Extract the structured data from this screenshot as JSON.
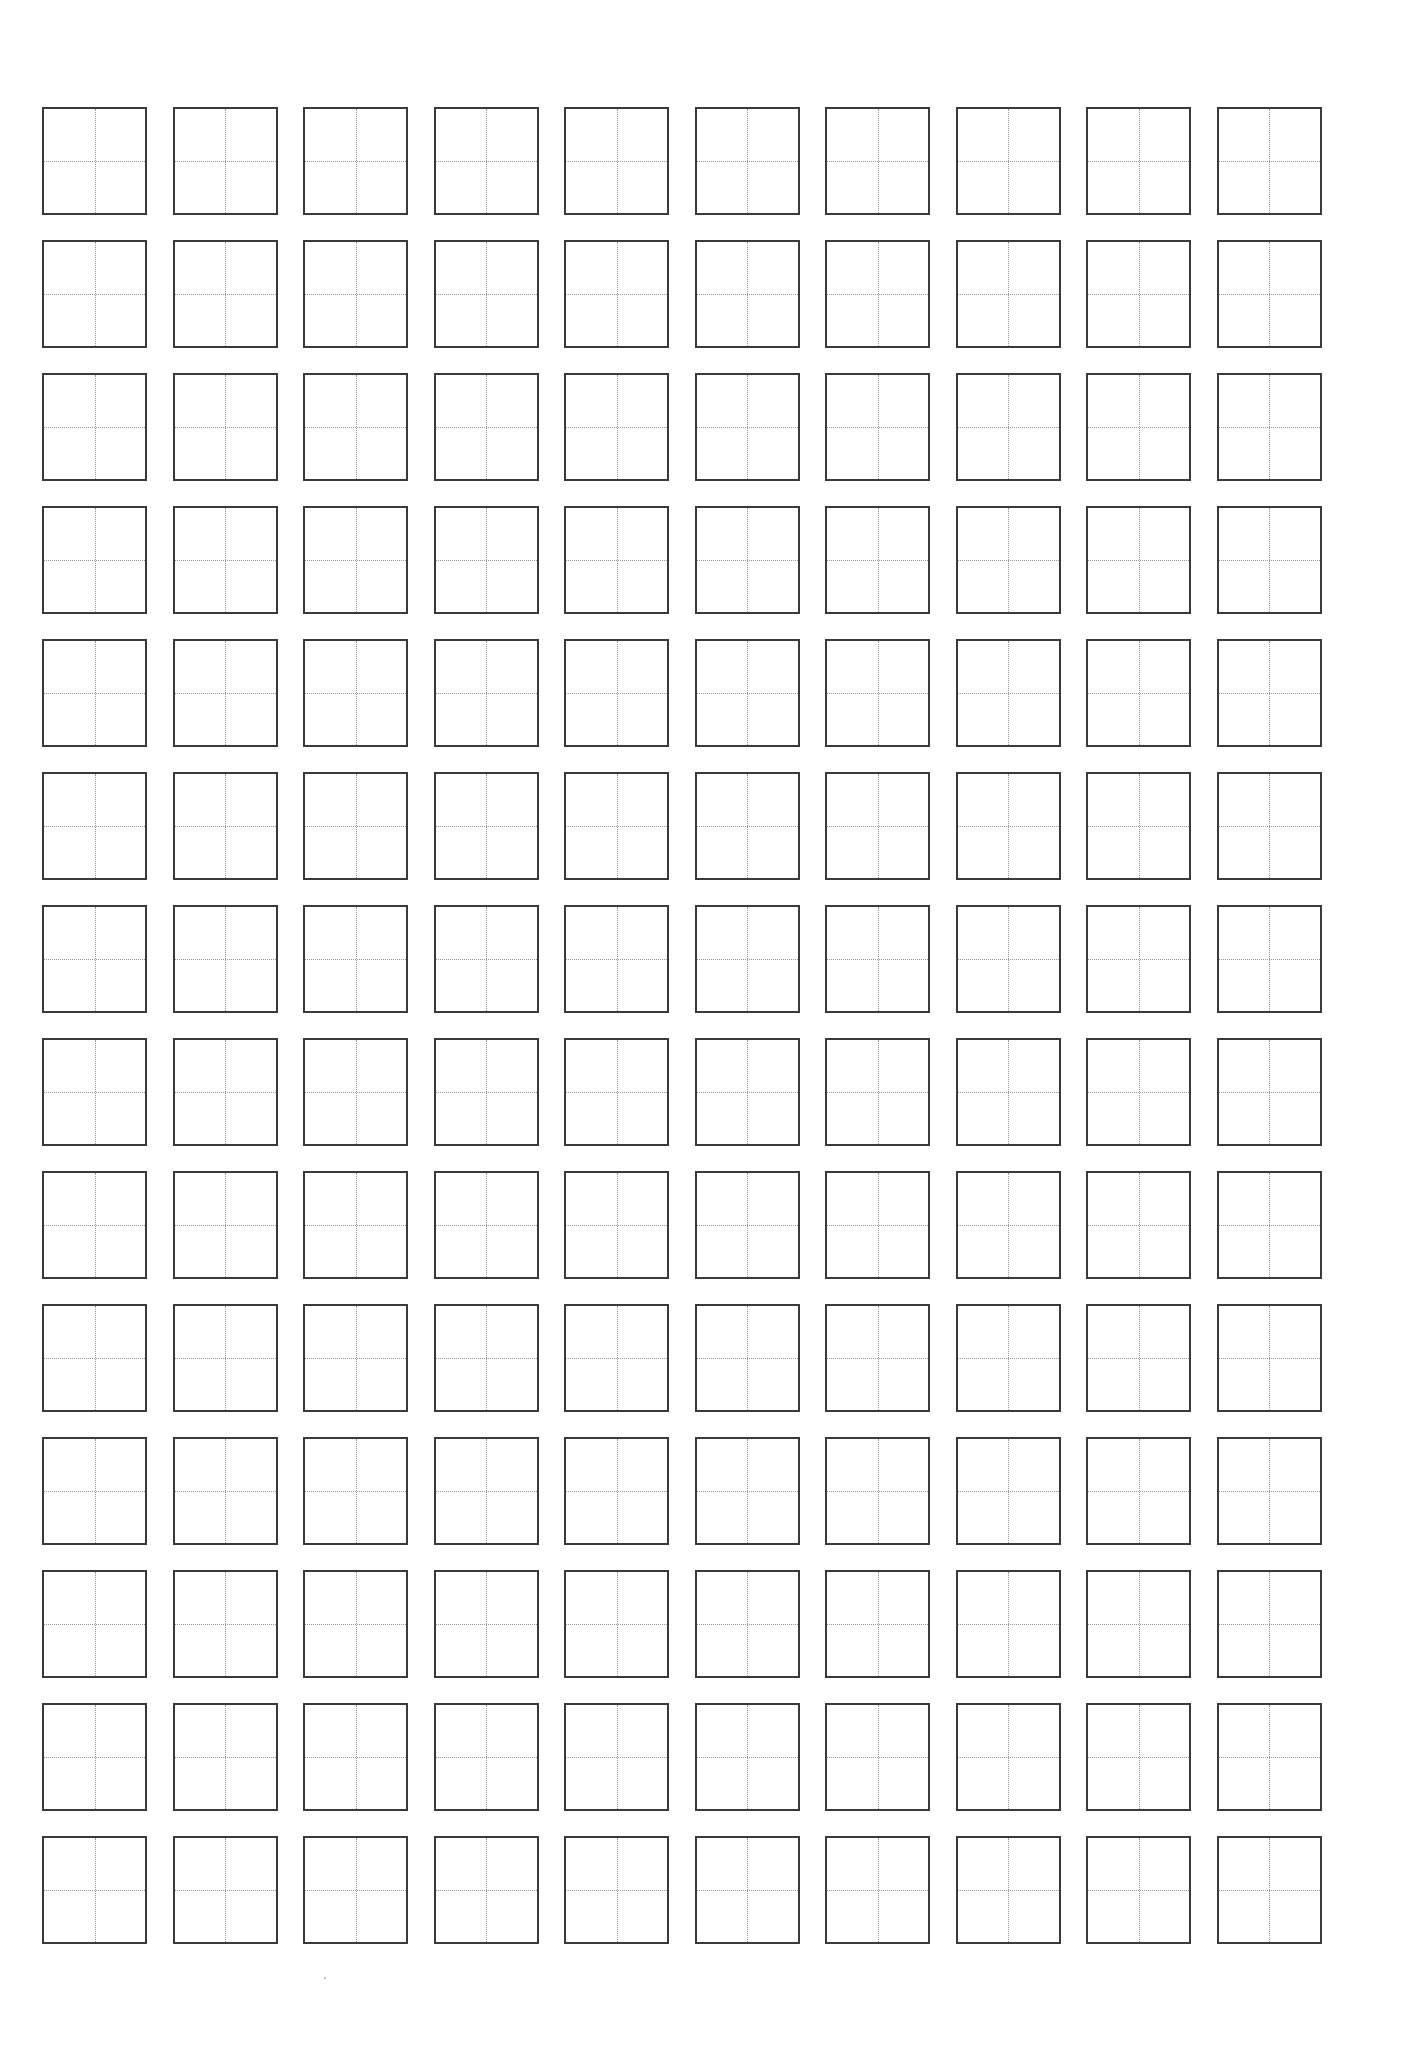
{
  "document": {
    "type": "tianzige-writing-practice-sheet",
    "rows": 14,
    "columns": 10,
    "cell_guides": "cross (dotted center lines)",
    "border_color": "#3a3a3a",
    "guide_color": "#9a9a9a",
    "background": "#ffffff",
    "text_content": []
  }
}
